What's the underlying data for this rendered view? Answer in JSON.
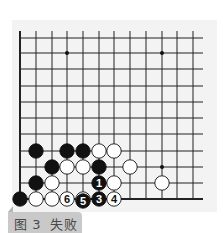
{
  "diagram": {
    "type": "go-board-fragment",
    "grid": {
      "columns_x": [
        20,
        36,
        52,
        67,
        83,
        99,
        114,
        130,
        146,
        162,
        177,
        193
      ],
      "rows_y": [
        38,
        53,
        69,
        86,
        102,
        118,
        134,
        151,
        167,
        183,
        199
      ],
      "line_color": "#222222",
      "edge_left": true,
      "edge_bottom": true
    },
    "hoshi": [
      {
        "col": 3,
        "row": 1
      },
      {
        "col": 9,
        "row": 1
      },
      {
        "col": 9,
        "row": 8
      }
    ],
    "stones": [
      {
        "color": "black",
        "col": 1,
        "row": 7,
        "label": ""
      },
      {
        "color": "black",
        "col": 3,
        "row": 7,
        "label": ""
      },
      {
        "color": "black",
        "col": 4,
        "row": 7,
        "label": ""
      },
      {
        "color": "white",
        "col": 5,
        "row": 7,
        "label": ""
      },
      {
        "color": "white",
        "col": 6,
        "row": 7,
        "label": ""
      },
      {
        "color": "black",
        "col": 2,
        "row": 8,
        "label": ""
      },
      {
        "color": "white",
        "col": 3,
        "row": 8,
        "label": ""
      },
      {
        "color": "white",
        "col": 4,
        "row": 8,
        "label": ""
      },
      {
        "color": "black",
        "col": 5,
        "row": 8,
        "label": ""
      },
      {
        "color": "white",
        "col": 7,
        "row": 8,
        "label": ""
      },
      {
        "color": "black",
        "col": 1,
        "row": 9,
        "label": ""
      },
      {
        "color": "white",
        "col": 2,
        "row": 9,
        "label": ""
      },
      {
        "color": "black",
        "col": 5,
        "row": 9,
        "label": "1"
      },
      {
        "color": "white",
        "col": 6,
        "row": 9,
        "label": ""
      },
      {
        "color": "white",
        "col": 9,
        "row": 9,
        "label": ""
      },
      {
        "color": "black",
        "col": 0,
        "row": 10,
        "label": ""
      },
      {
        "color": "white",
        "col": 1,
        "row": 10,
        "label": ""
      },
      {
        "color": "white",
        "col": 2,
        "row": 10,
        "label": ""
      },
      {
        "color": "white",
        "col": 3,
        "row": 10,
        "label": "6"
      },
      {
        "color": "white",
        "col": 4,
        "row": 10,
        "label": "2"
      },
      {
        "color": "black",
        "col": 5,
        "row": 10,
        "label": "3"
      },
      {
        "color": "white",
        "col": 6,
        "row": 10,
        "label": "4"
      },
      {
        "color": "black",
        "col": 4,
        "row": 11,
        "label": "5"
      }
    ]
  },
  "caption": {
    "figure": "图 3",
    "title": "失败",
    "full": "图 3  失败"
  }
}
